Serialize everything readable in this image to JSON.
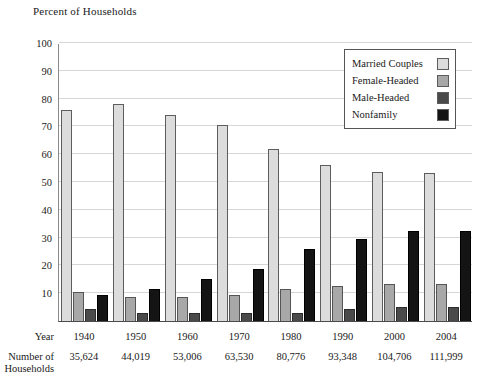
{
  "chart_data": {
    "type": "bar",
    "title": "Percent of Households",
    "xlabel": "Year",
    "ylabel": "Percent of Households",
    "ylim": [
      0,
      100
    ],
    "yticks": [
      10,
      20,
      30,
      40,
      50,
      60,
      70,
      80,
      90,
      100
    ],
    "grid": true,
    "legend_position": "top-right",
    "categories": [
      "1940",
      "1950",
      "1960",
      "1970",
      "1980",
      "1990",
      "2000",
      "2004"
    ],
    "series": [
      {
        "name": "Married Couples",
        "color": "#dcdcdc",
        "values": [
          75.8,
          78.2,
          74.2,
          70.6,
          61.8,
          56.2,
          53.6,
          53.2
        ]
      },
      {
        "name": "Female-Headed",
        "color": "#a8a8a8",
        "values": [
          10.5,
          8.7,
          8.8,
          9.3,
          11.6,
          12.7,
          13.4,
          13.4
        ]
      },
      {
        "name": "Male-Headed",
        "color": "#4a4a4a",
        "values": [
          4.3,
          3.0,
          3.0,
          2.9,
          3.0,
          4.3,
          4.9,
          4.9
        ]
      },
      {
        "name": "Nonfamily",
        "color": "#141414",
        "values": [
          9.5,
          11.5,
          15.0,
          18.8,
          26.0,
          29.6,
          32.5,
          32.5
        ]
      }
    ],
    "table": {
      "row_labels": [
        "Year",
        "Number of Households"
      ],
      "rows": [
        {
          "label": "Year",
          "label_line1": "Year",
          "label_line2": "",
          "values": [
            "1940",
            "1950",
            "1960",
            "1970",
            "1980",
            "1990",
            "2000",
            "2004"
          ]
        },
        {
          "label": "Number of Households",
          "label_line1": "Number of",
          "label_line2": "Households",
          "values": [
            "35,624",
            "44,019",
            "53,006",
            "63,530",
            "80,776",
            "93,348",
            "104,706",
            "111,999"
          ]
        }
      ]
    }
  }
}
